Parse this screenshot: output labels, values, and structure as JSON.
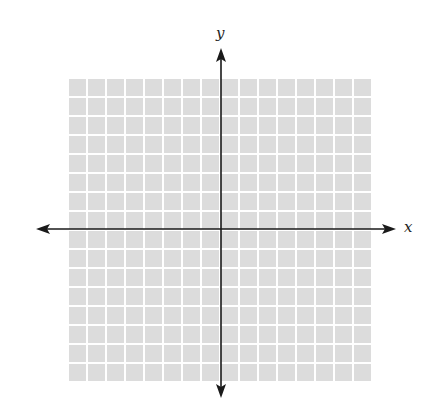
{
  "diagram": {
    "type": "cartesian-coordinate-grid",
    "grid": {
      "columns": 16,
      "rows": 16,
      "cell_size_px": 19,
      "left_px": 68,
      "top_px": 78,
      "cell_color": "#dcdcdc",
      "line_color": "#ffffff",
      "line_width_px": 2
    },
    "axes": {
      "color": "#1a1a1a",
      "origin_px": {
        "x": 221,
        "y": 229
      },
      "x_axis": {
        "label": "x",
        "start_px": 36,
        "end_px": 396,
        "arrows": "both"
      },
      "y_axis": {
        "label": "y",
        "start_px": 48,
        "end_px": 398,
        "arrows": "both"
      }
    }
  }
}
